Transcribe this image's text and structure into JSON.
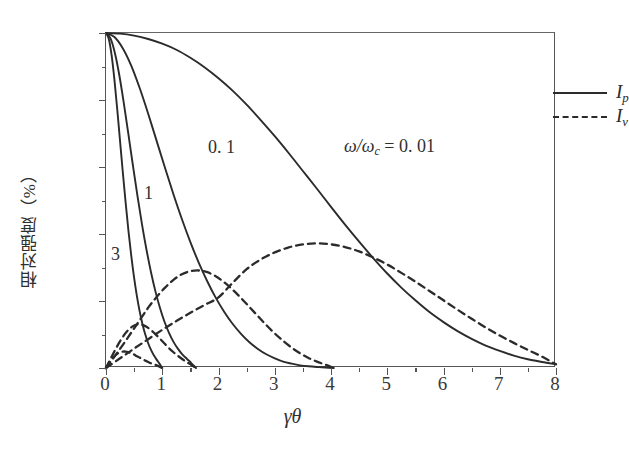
{
  "figure": {
    "x_axis_title": "γθ",
    "y_axis_title": "相对强度（%）",
    "annotation": {
      "prefix": "ω/ω",
      "subscript": "c",
      "equals": " = 0. 01"
    }
  },
  "legend": {
    "position": "top-right",
    "entries": [
      {
        "label": "I",
        "subscript": "p",
        "style": "solid"
      },
      {
        "label": "I",
        "subscript": "v",
        "style": "dashed"
      }
    ]
  },
  "curve_labels": [
    {
      "text": "0. 1",
      "x_px": 207,
      "y_px": 136
    },
    {
      "text": "1",
      "x_px": 143,
      "y_px": 182
    },
    {
      "text": "3",
      "x_px": 110,
      "y_px": 243
    }
  ],
  "chart_data": {
    "type": "line",
    "title": "",
    "xlabel": "γθ",
    "ylabel": "相对强度（%）",
    "xlim": [
      0,
      8
    ],
    "ylim": [
      0,
      100
    ],
    "xticks": [
      0,
      1,
      2,
      3,
      4,
      5,
      6,
      7,
      8
    ],
    "yticks": [
      0,
      20,
      40,
      60,
      80,
      100
    ],
    "xticks_minor": [
      0.5,
      1.5,
      2.5,
      3.5,
      4.5,
      5.5,
      6.5,
      7.5
    ],
    "yticks_minor": [
      10,
      30,
      50,
      70,
      90
    ],
    "grid": false,
    "legend_position": "upper right",
    "annotations": [
      {
        "text": "ω/ω_c = 0. 01",
        "x": 4.2,
        "y": 68
      },
      {
        "text": "0. 1",
        "x": 1.85,
        "y": 63
      },
      {
        "text": "1",
        "x": 0.7,
        "y": 49
      },
      {
        "text": "3",
        "x": 0.1,
        "y": 31
      }
    ],
    "series": [
      {
        "name": "I_p, ω/ω_c = 0.01",
        "style": "solid",
        "color": "#2b2b2b",
        "x": [
          0,
          0.25,
          0.5,
          0.75,
          1,
          1.25,
          1.5,
          1.75,
          2,
          2.25,
          2.5,
          2.75,
          3,
          3.25,
          3.5,
          3.75,
          4,
          4.25,
          4.5,
          4.75,
          5,
          5.25,
          5.5,
          5.75,
          6,
          6.25,
          6.5,
          6.75,
          7,
          7.25,
          7.5,
          7.75,
          8
        ],
        "y": [
          100,
          99.8,
          99.2,
          98.2,
          96.8,
          95,
          92.6,
          89.8,
          86.5,
          82.8,
          78.6,
          74,
          69.2,
          64.1,
          58.8,
          53.5,
          48.1,
          42.8,
          37.7,
          32.8,
          28.2,
          24,
          20.2,
          16.7,
          13.7,
          11,
          8.7,
          6.7,
          5.1,
          3.7,
          2.6,
          1.8,
          1.1
        ]
      },
      {
        "name": "I_p, ω/ω_c = 0.1",
        "style": "solid",
        "color": "#2b2b2b",
        "x": [
          0,
          0.15,
          0.3,
          0.45,
          0.6,
          0.75,
          0.9,
          1.05,
          1.2,
          1.35,
          1.5,
          1.65,
          1.8,
          1.95,
          2.1,
          2.25,
          2.4,
          2.55,
          2.7,
          2.85,
          3,
          3.15,
          3.3,
          3.45,
          3.6,
          3.75,
          3.9,
          4.05
        ],
        "y": [
          100,
          98.8,
          95.4,
          90.2,
          83.5,
          75.9,
          67.8,
          59.7,
          51.8,
          44.4,
          37.6,
          31.4,
          25.9,
          21,
          16.8,
          13.2,
          10.2,
          7.7,
          5.7,
          4.1,
          2.9,
          1.9,
          1.3,
          0.8,
          0.5,
          0.3,
          0.15,
          0
        ]
      },
      {
        "name": "I_p, ω/ω_c = 1",
        "style": "solid",
        "color": "#2b2b2b",
        "x": [
          0,
          0.08,
          0.16,
          0.24,
          0.32,
          0.4,
          0.48,
          0.56,
          0.64,
          0.72,
          0.8,
          0.88,
          0.96,
          1.04,
          1.12,
          1.2,
          1.28,
          1.36,
          1.44,
          1.52,
          1.6
        ],
        "y": [
          100,
          98.4,
          93.9,
          87.1,
          78.7,
          69.6,
          60.3,
          51.3,
          42.9,
          35.3,
          28.6,
          22.8,
          17.9,
          13.8,
          10.5,
          7.8,
          5.7,
          4,
          2.7,
          1.4,
          0
        ]
      },
      {
        "name": "I_p, ω/ω_c = 3",
        "style": "solid",
        "color": "#2b2b2b",
        "x": [
          0,
          0.05,
          0.1,
          0.15,
          0.2,
          0.25,
          0.3,
          0.35,
          0.4,
          0.45,
          0.5,
          0.55,
          0.6,
          0.65,
          0.7,
          0.75,
          0.8,
          0.85,
          0.9,
          0.95,
          1.0
        ],
        "y": [
          100,
          98.2,
          93.3,
          86,
          77.2,
          67.7,
          58.2,
          49.2,
          40.8,
          33.4,
          26.9,
          21.4,
          16.8,
          13,
          9.9,
          7.4,
          5.4,
          3.8,
          2.5,
          1.3,
          0
        ]
      },
      {
        "name": "I_v, ω/ω_c = 0.01",
        "style": "dashed",
        "color": "#2b2b2b",
        "x": [
          0,
          0.25,
          0.5,
          0.75,
          1,
          1.25,
          1.5,
          1.75,
          2,
          2.25,
          2.5,
          2.75,
          3,
          3.25,
          3.5,
          3.75,
          4,
          4.25,
          4.5,
          4.75,
          5,
          5.25,
          5.5,
          5.75,
          6,
          6.25,
          6.5,
          6.75,
          7,
          7.25,
          7.5,
          7.75,
          8
        ],
        "y": [
          0,
          2.9,
          5.8,
          8.6,
          11.4,
          14,
          16.5,
          18.8,
          21.1,
          25.4,
          29.5,
          32.4,
          34.5,
          36,
          36.9,
          37.2,
          36.9,
          36.1,
          34.8,
          33,
          30.9,
          28.4,
          25.8,
          23,
          20.2,
          17.4,
          14.7,
          12.1,
          9.7,
          7.5,
          5.4,
          3.4,
          1.1
        ]
      },
      {
        "name": "I_v, ω/ω_c = 0.1",
        "style": "dashed",
        "color": "#2b2b2b",
        "x": [
          0,
          0.15,
          0.3,
          0.45,
          0.6,
          0.75,
          0.9,
          1.05,
          1.2,
          1.35,
          1.5,
          1.65,
          1.8,
          1.95,
          2.1,
          2.25,
          2.4,
          2.55,
          2.7,
          2.85,
          3,
          3.15,
          3.3,
          3.45,
          3.6,
          3.75,
          3.9,
          4.05
        ],
        "y": [
          0,
          3.4,
          6.9,
          10.6,
          14.3,
          18,
          21.2,
          24,
          26.3,
          28,
          28.9,
          29.1,
          28.6,
          27.4,
          25.6,
          23.4,
          20.9,
          18.2,
          15.5,
          12.8,
          10.3,
          8.1,
          6.1,
          4.4,
          3,
          1.9,
          1,
          0
        ]
      },
      {
        "name": "I_v, ω/ω_c = 1",
        "style": "dashed",
        "color": "#2b2b2b",
        "x": [
          0,
          0.08,
          0.16,
          0.24,
          0.32,
          0.4,
          0.48,
          0.56,
          0.64,
          0.72,
          0.8,
          0.88,
          0.96,
          1.04,
          1.12,
          1.2,
          1.28,
          1.36,
          1.44,
          1.52,
          1.6
        ],
        "y": [
          0,
          2.7,
          5.3,
          7.7,
          9.8,
          11.4,
          12.5,
          13,
          12.9,
          12.3,
          11.3,
          10.1,
          8.7,
          7.3,
          5.9,
          4.7,
          3.6,
          2.6,
          1.7,
          0.9,
          0
        ]
      },
      {
        "name": "I_v, ω/ω_c = 3",
        "style": "dashed",
        "color": "#2b2b2b",
        "x": [
          0,
          0.05,
          0.1,
          0.15,
          0.2,
          0.25,
          0.3,
          0.35,
          0.4,
          0.45,
          0.5,
          0.55,
          0.6,
          0.65,
          0.7,
          0.75,
          0.8,
          0.85,
          0.9,
          0.95,
          1.0
        ],
        "y": [
          0,
          1.3,
          2.5,
          3.5,
          4.2,
          4.7,
          4.9,
          4.9,
          4.7,
          4.4,
          4,
          3.5,
          3.1,
          2.6,
          2.2,
          1.8,
          1.4,
          1.1,
          0.8,
          0.4,
          0
        ]
      }
    ]
  }
}
